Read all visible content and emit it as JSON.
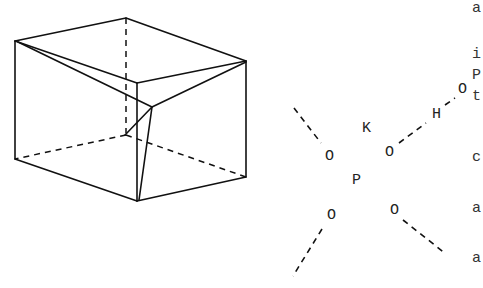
{
  "figure": {
    "prism": {
      "description": "Wireframe rectangular prism with internal skew edges; hidden edges dashed"
    },
    "molecule": {
      "atoms": {
        "K": "K",
        "P": "P",
        "O_upper_left": "O",
        "O_upper_right": "O",
        "O_lower_left": "O",
        "O_lower_right": "O",
        "H": "H",
        "O_far": "O"
      }
    },
    "cut_text": [
      "a",
      "i",
      "P",
      "t",
      "c",
      "a",
      "a"
    ]
  }
}
